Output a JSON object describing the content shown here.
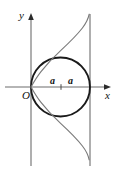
{
  "figure": {
    "axes": {
      "y_label": "y",
      "x_label": "x",
      "origin_label": "O"
    },
    "segment_labels": {
      "left": "a",
      "right": "a"
    },
    "colors": {
      "axis": "#6d6d6d",
      "curve": "#7a7a7a",
      "circle": "#1a1a1a",
      "asymptote": "#6d6d6d",
      "text": "#111111",
      "background": "#ffffff"
    },
    "geometry": {
      "origin_px": [
        31,
        87
      ],
      "circle_center_px": [
        60.5,
        87
      ],
      "circle_radius_px": 29.5,
      "asymptote_x_px": 90,
      "y_axis_x_px": 31,
      "x_axis_y_px": 87,
      "a_px": 29.5,
      "vertical_extent_px": [
        14,
        166
      ]
    }
  }
}
